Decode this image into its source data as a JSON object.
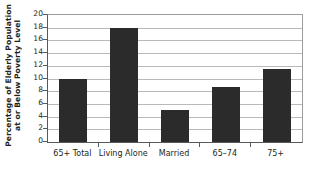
{
  "chart_data": {
    "type": "bar",
    "title": "",
    "xlabel": "",
    "ylabel": "Percentage of Elderly Population at or Below Poverty Level",
    "ylabel_lines": [
      "Percentage of Elderly Population",
      "at or Below Poverty Level"
    ],
    "categories": [
      "65+ Total",
      "Living Alone",
      "Married",
      "65–74",
      "75+"
    ],
    "values": [
      10,
      18,
      5,
      8.6,
      11.5
    ],
    "ylim": [
      0,
      20
    ],
    "ytick_values": [
      0,
      2,
      4,
      6,
      8,
      10,
      12,
      14,
      16,
      18,
      20
    ],
    "ytick_labels": [
      "0",
      "2",
      "4",
      "6",
      "8",
      "10",
      "12",
      "14",
      "16",
      "18",
      "20"
    ],
    "grid": "horizontal",
    "legend": "none",
    "bar_color": "#2b2b2b",
    "gridline_color": "#b9babc",
    "axis_color": "#58595b",
    "background_color": "#ffffff"
  }
}
